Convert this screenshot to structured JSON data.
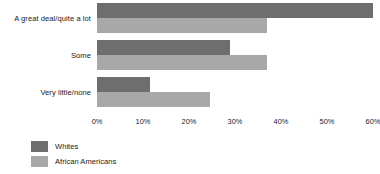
{
  "chart_data": {
    "type": "bar",
    "orientation": "horizontal",
    "title": "",
    "subtitle": "",
    "xlabel": "",
    "ylabel": "",
    "xlim": [
      0,
      60
    ],
    "xticks": [
      0,
      10,
      20,
      30,
      40,
      50,
      60
    ],
    "xtick_labels": [
      "0%",
      "10%",
      "20%",
      "30%",
      "40%",
      "50%",
      "60%"
    ],
    "grid": false,
    "legend_position": "bottom-left",
    "categories": [
      "A great deal/quite a lot",
      "Some",
      "Very little/none"
    ],
    "series": [
      {
        "name": "Whites",
        "color": "#6e6e6e",
        "values": [
          60,
          29,
          11.5
        ]
      },
      {
        "name": "African Americans",
        "color": "#a8a8a8",
        "values": [
          37,
          37,
          24.5
        ]
      }
    ]
  }
}
